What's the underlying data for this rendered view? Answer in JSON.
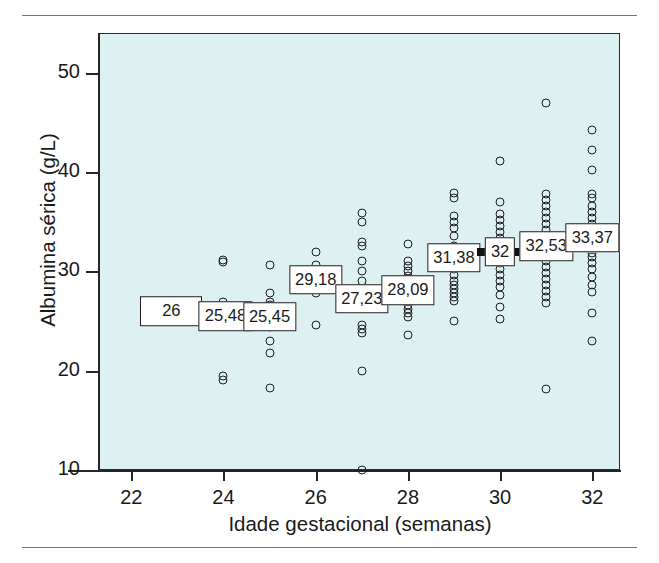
{
  "chart_data": {
    "type": "scatter",
    "title": "",
    "xlabel": "Idade gestacional (semanas)",
    "ylabel": "Albumina sérica (g/L)",
    "xlim": [
      21.3,
      32.6
    ],
    "ylim": [
      10,
      54
    ],
    "xticks": [
      22,
      24,
      26,
      28,
      30,
      32
    ],
    "yticks": [
      10,
      20,
      30,
      40,
      50
    ],
    "grid": false,
    "legend": null,
    "background_color": "#ddf1f3",
    "marker": "open-circle",
    "mean_marker": "black-bar-with-label-box",
    "groups": [
      {
        "x": 23,
        "mean": 26,
        "mean_label": "26",
        "values": [
          26
        ]
      },
      {
        "x": 24,
        "mean": 25.48,
        "mean_label": "25,48",
        "values": [
          31.1,
          30.9,
          26.9,
          25.5,
          19.5,
          19.1
        ]
      },
      {
        "x": 25,
        "mean": 25.45,
        "mean_label": "25,45",
        "values": [
          30.6,
          27.8,
          26.9,
          26.6,
          26.2,
          25.4,
          24.4,
          23.0,
          21.8,
          18.3
        ]
      },
      {
        "x": 26,
        "mean": 29.18,
        "mean_label": "29,18",
        "values": [
          32.0,
          30.6,
          29.8,
          29.2,
          27.8,
          24.6
        ]
      },
      {
        "x": 27,
        "mean": 27.23,
        "mean_label": "27,23",
        "values": [
          35.9,
          35.0,
          33.0,
          32.6,
          31.0,
          30.0,
          29.0,
          28.0,
          27.2,
          26.9,
          24.6,
          24.2,
          23.8,
          20.0,
          10.0
        ]
      },
      {
        "x": 28,
        "mean": 28.09,
        "mean_label": "28,09",
        "values": [
          32.8,
          31.0,
          30.5,
          30.0,
          29.5,
          29.2,
          28.8,
          28.4,
          28.1,
          27.4,
          27.0,
          26.6,
          26.2,
          25.8,
          25.4,
          23.6
        ]
      },
      {
        "x": 29,
        "mean": 31.38,
        "mean_label": "31,38",
        "values": [
          37.9,
          37.4,
          35.6,
          35.0,
          34.4,
          33.6,
          32.6,
          31.4,
          30.8,
          30.2,
          29.6,
          29.0,
          28.6,
          28.2,
          27.8,
          27.4,
          27.0,
          25.0
        ]
      },
      {
        "x": 30,
        "mean": 32,
        "mean_label": "32",
        "values": [
          41.1,
          37.0,
          35.8,
          35.2,
          34.6,
          34.0,
          33.4,
          32.8,
          32.0,
          31.4,
          30.8,
          30.2,
          29.6,
          29.0,
          28.4,
          27.6,
          26.4,
          25.2
        ]
      },
      {
        "x": 31,
        "mean": 32.53,
        "mean_label": "32,53",
        "values": [
          47.0,
          37.8,
          37.2,
          36.6,
          36.0,
          35.4,
          34.8,
          34.2,
          33.6,
          32.5,
          31.6,
          31.0,
          30.4,
          29.8,
          29.2,
          28.6,
          28.0,
          27.4,
          26.8,
          18.2
        ]
      },
      {
        "x": 32,
        "mean": 33.37,
        "mean_label": "33,37",
        "values": [
          44.2,
          42.2,
          40.2,
          37.8,
          37.4,
          36.6,
          36.0,
          35.4,
          34.8,
          34.2,
          33.4,
          31.8,
          31.4,
          30.8,
          30.2,
          29.4,
          28.6,
          27.9,
          25.8,
          23.0
        ]
      }
    ]
  }
}
